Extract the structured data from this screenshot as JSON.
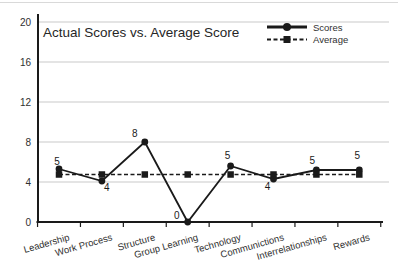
{
  "chart_data": {
    "type": "line",
    "title": "Actual Scores vs. Average Score",
    "categories": [
      "Leadership",
      "Work Process",
      "Structure",
      "Group Learning",
      "Technology",
      "Communictions",
      "Interrelationships",
      "Rewards"
    ],
    "series": [
      {
        "name": "Scores",
        "values": [
          5,
          4,
          8,
          0,
          5,
          4,
          5,
          5
        ],
        "data_labels": [
          "5",
          "4",
          "8",
          "0",
          "5",
          "4",
          "5",
          "5"
        ],
        "plotted_values": [
          5.3,
          4.1,
          8.0,
          0.0,
          5.6,
          4.3,
          5.2,
          5.2
        ],
        "marker": "circle",
        "line_style": "solid"
      },
      {
        "name": "Average",
        "values": [
          4.75,
          4.75,
          4.75,
          4.75,
          4.75,
          4.75,
          4.75,
          4.75
        ],
        "data_labels": [],
        "plotted_values": [
          4.75,
          4.75,
          4.75,
          4.75,
          4.75,
          4.75,
          4.75,
          4.75
        ],
        "marker": "square",
        "line_style": "dashed"
      }
    ],
    "xlabel": "",
    "ylabel": "",
    "ylim": [
      0,
      20
    ],
    "yticks": [
      0,
      4,
      8,
      12,
      16,
      20
    ],
    "grid": true,
    "legend_position": "top-right",
    "label_offsets": [
      [
        -2,
        -8
      ],
      [
        5,
        6
      ],
      [
        -10,
        -9
      ],
      [
        -11,
        -7
      ],
      [
        -3,
        -11
      ],
      [
        -6,
        7
      ],
      [
        -4,
        -10
      ],
      [
        -2,
        -15
      ]
    ],
    "colors": {
      "series": "#1a1a1a",
      "grid": "#c9c9c9",
      "text": "#303030",
      "top_rule": "#d9d9d9"
    }
  }
}
